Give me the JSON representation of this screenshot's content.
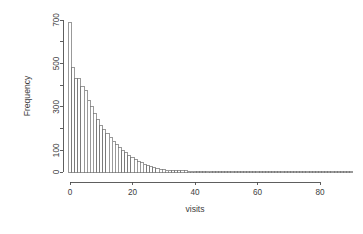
{
  "chart_data": {
    "type": "bar",
    "title": "",
    "subtitle": "",
    "xlabel": "visits",
    "ylabel": "Frequency",
    "xlim": [
      -1,
      91
    ],
    "ylim": [
      0,
      720
    ],
    "grid": false,
    "legend": null,
    "bin_width": 1,
    "x_ticks": [
      0,
      20,
      40,
      60,
      80
    ],
    "x_tick_labels": [
      "0",
      "20",
      "40",
      "60",
      "80"
    ],
    "y_ticks": [
      0,
      100,
      200,
      300,
      400,
      500,
      600,
      700
    ],
    "y_tick_labels": [
      "0",
      "",
      "100",
      "",
      "300",
      "",
      "500",
      "",
      "700"
    ],
    "y_labeled_ticks": [
      0,
      100,
      300,
      500,
      700
    ],
    "y_labeled_tick_labels": [
      "0",
      "100",
      "300",
      "500",
      "700"
    ],
    "y_minor_ticks": [
      200,
      400,
      600
    ],
    "bar_outline_color": "#6e6e6e",
    "bar_fill_color": "#ffffff",
    "axis_color": "#4d4d4d",
    "categories": [
      0,
      1,
      2,
      3,
      4,
      5,
      6,
      7,
      8,
      9,
      10,
      11,
      12,
      13,
      14,
      15,
      16,
      17,
      18,
      19,
      20,
      21,
      22,
      23,
      24,
      25,
      26,
      27,
      28,
      29,
      30,
      31,
      32,
      33,
      34,
      35,
      36,
      37,
      38,
      39,
      40,
      41,
      42,
      43,
      44,
      45,
      46,
      47,
      48,
      49,
      50,
      51,
      52,
      53,
      54,
      55,
      56,
      57,
      58,
      59,
      60,
      61,
      62,
      63,
      64,
      65,
      66,
      67,
      68,
      69,
      70,
      71,
      72,
      73,
      74,
      75,
      76,
      77,
      78,
      79,
      80,
      81,
      82,
      83,
      84,
      85,
      86,
      87,
      88,
      89,
      90
    ],
    "values": [
      688,
      480,
      432,
      430,
      392,
      376,
      330,
      300,
      268,
      240,
      214,
      196,
      176,
      160,
      142,
      126,
      112,
      100,
      90,
      78,
      66,
      56,
      48,
      42,
      36,
      28,
      24,
      20,
      16,
      13,
      11,
      9,
      8,
      7,
      6,
      6,
      5,
      5,
      4,
      4,
      4,
      3,
      3,
      3,
      3,
      3,
      2,
      2,
      2,
      2,
      2,
      2,
      2,
      2,
      1,
      1,
      1,
      1,
      1,
      1,
      1,
      1,
      1,
      1,
      1,
      1,
      1,
      1,
      1,
      1,
      1,
      1,
      1,
      1,
      1,
      1,
      1,
      1,
      1,
      1,
      1,
      1,
      1,
      1,
      1,
      1,
      1,
      1,
      1,
      1,
      1
    ]
  },
  "labels": {
    "x_axis_title": "visits",
    "y_axis_title": "Frequency"
  }
}
